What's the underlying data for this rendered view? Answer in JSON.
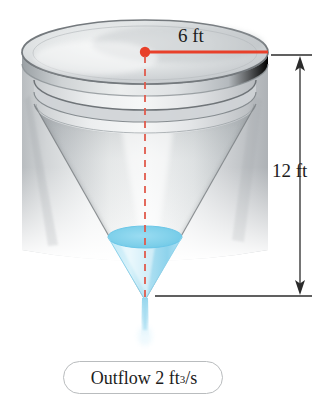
{
  "figure": {
    "labels": {
      "diameter": "6 ft",
      "height": "12 ft",
      "outflow_prefix": "Outflow 2 ft",
      "outflow_exponent": "3",
      "outflow_suffix": "/s"
    },
    "colors": {
      "radius_line": "#e8402a",
      "center_dot": "#e8402a",
      "axis_dash": "#e05a4c",
      "water": "#a9e2f3",
      "water_surface": "#7fd3ee",
      "dimension_line": "#2b2b2b",
      "metal_light": "#f2f3f4",
      "metal_mid": "#c9ccce",
      "metal_dark": "#8f9497",
      "outflow_border": "#b9bcbe",
      "text": "#1c1c1c"
    },
    "geometry": {
      "top_ellipse_cx": 145,
      "top_ellipse_cy": 52,
      "top_ellipse_rx": 123,
      "top_ellipse_ry": 32,
      "cone_tip_x": 145,
      "cone_tip_y": 300,
      "water_surface_cy": 237,
      "water_surface_rx": 37,
      "dimension_x": 300,
      "dimension_top_y": 55,
      "dimension_bottom_y": 296
    },
    "icons": {
      "arrow_up": "arrow-up-icon",
      "arrow_down": "arrow-down-icon",
      "radius_dot": "center-dot-icon"
    }
  }
}
